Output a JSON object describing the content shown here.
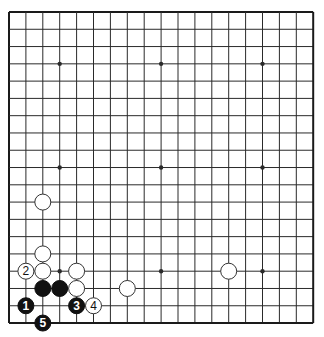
{
  "board": {
    "size": 19,
    "origin_x": 9,
    "origin_y": 12,
    "spacing_x": 16.9,
    "spacing_y": 17.28,
    "stone_radius": 8,
    "colors": {
      "background": "#ffffff",
      "line": "#2a2a2a",
      "black_stone": "#111111",
      "white_stone": "#ffffff",
      "white_outline": "#333333"
    },
    "star_points": [
      [
        3,
        3
      ],
      [
        9,
        3
      ],
      [
        15,
        3
      ],
      [
        3,
        9
      ],
      [
        9,
        9
      ],
      [
        15,
        9
      ],
      [
        3,
        15
      ],
      [
        9,
        15
      ],
      [
        15,
        15
      ]
    ],
    "stones": [
      {
        "color": "white",
        "col": 2,
        "row": 11,
        "label": ""
      },
      {
        "color": "white",
        "col": 2,
        "row": 14,
        "label": ""
      },
      {
        "color": "white",
        "col": 1,
        "row": 15,
        "label": "2"
      },
      {
        "color": "white",
        "col": 2,
        "row": 15,
        "label": ""
      },
      {
        "color": "white",
        "col": 4,
        "row": 15,
        "label": ""
      },
      {
        "color": "white",
        "col": 13,
        "row": 15,
        "label": ""
      },
      {
        "color": "black",
        "col": 2,
        "row": 16,
        "label": ""
      },
      {
        "color": "black",
        "col": 3,
        "row": 16,
        "label": ""
      },
      {
        "color": "white",
        "col": 4,
        "row": 16,
        "label": ""
      },
      {
        "color": "white",
        "col": 7,
        "row": 16,
        "label": ""
      },
      {
        "color": "black",
        "col": 1,
        "row": 17,
        "label": "1"
      },
      {
        "color": "black",
        "col": 4,
        "row": 17,
        "label": "3"
      },
      {
        "color": "white",
        "col": 5,
        "row": 17,
        "label": "4"
      },
      {
        "color": "black",
        "col": 2,
        "row": 18,
        "label": "5"
      }
    ]
  }
}
